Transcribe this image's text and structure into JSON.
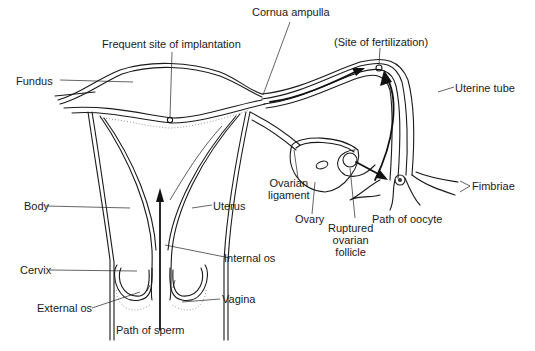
{
  "diagram": {
    "line_color": "#1a1a1a",
    "background": "#ffffff",
    "labels": {
      "cornua_ampulla": "Cornua ampulla",
      "frequent_site": "Frequent site of implantation",
      "site_fertilization": "(Site of fertilization)",
      "fundus": "Fundus",
      "uterine_tube": "Uterine tube",
      "fimbriae": "Fimbriae",
      "ovarian_ligament_1": "Ovarian",
      "ovarian_ligament_2": "ligament",
      "ovary": "Ovary",
      "path_oocyte": "Path of oocyte",
      "body": "Body",
      "uterus": "Uterus",
      "ruptured_1": "Ruptured",
      "ruptured_2": "ovarian",
      "ruptured_3": "follicle",
      "internal_os": "Internal os",
      "cervix": "Cervix",
      "vagina": "Vagina",
      "external_os": "External os",
      "path_sperm": "Path of sperm"
    },
    "icons": {
      "oocyte": "oocyte-cell-icon",
      "implantation": "implantation-site-icon",
      "fertilization": "fertilization-site-icon"
    }
  }
}
